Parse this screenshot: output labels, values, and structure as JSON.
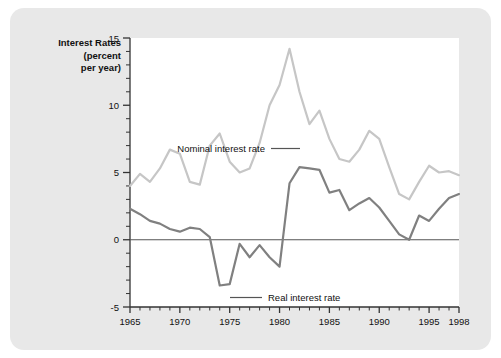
{
  "figure": {
    "background_color": "#e8e8e8",
    "plot_background_color": "#ffffff",
    "page_background_color": "#ffffff"
  },
  "chart_data": {
    "type": "line",
    "title": "",
    "ylabel_lines": [
      "Interest Rates",
      "(percent",
      "per year)"
    ],
    "ylabel": "Interest Rates (percent per year)",
    "xlabel": "",
    "xlim": [
      1965,
      1998
    ],
    "ylim": [
      -5,
      15
    ],
    "y_ticks": [
      -5,
      0,
      5,
      10,
      15
    ],
    "y_tick_labels": [
      "-5",
      "0",
      "5",
      "10",
      "15"
    ],
    "y_minor_step": 1,
    "x_ticks": [
      1965,
      1970,
      1975,
      1980,
      1985,
      1990,
      1995,
      1998
    ],
    "x_tick_labels": [
      "1965",
      "1970",
      "1975",
      "1980",
      "1985",
      "1990",
      "1995",
      "1998"
    ],
    "x_minor_step": 1,
    "grid": false,
    "zero_line": 0,
    "legend_position": "inline-annotations",
    "x": [
      1965,
      1966,
      1967,
      1968,
      1969,
      1970,
      1971,
      1972,
      1973,
      1974,
      1975,
      1976,
      1977,
      1978,
      1979,
      1980,
      1981,
      1982,
      1983,
      1984,
      1985,
      1986,
      1987,
      1988,
      1989,
      1990,
      1991,
      1992,
      1993,
      1994,
      1995,
      1996,
      1997,
      1998
    ],
    "series": [
      {
        "name": "Nominal interest rate",
        "color": "#c6c6c6",
        "label": "Nominal interest rate",
        "values": [
          4.0,
          4.9,
          4.3,
          5.3,
          6.7,
          6.4,
          4.3,
          4.1,
          7.0,
          7.9,
          5.8,
          5.0,
          5.3,
          7.2,
          10.0,
          11.5,
          14.2,
          11.0,
          8.6,
          9.6,
          7.5,
          6.0,
          5.8,
          6.7,
          8.1,
          7.5,
          5.4,
          3.4,
          3.0,
          4.3,
          5.5,
          5.0,
          5.1,
          4.8
        ]
      },
      {
        "name": "Real interest rate",
        "color": "#808080",
        "label": "Real interest rate",
        "values": [
          2.3,
          1.9,
          1.4,
          1.2,
          0.8,
          0.6,
          0.9,
          0.8,
          0.2,
          -3.4,
          -3.3,
          -0.3,
          -1.3,
          -0.4,
          -1.3,
          -2.0,
          4.2,
          5.4,
          5.3,
          5.2,
          3.5,
          3.7,
          2.2,
          2.7,
          3.1,
          2.4,
          1.4,
          0.4,
          0.0,
          1.8,
          1.4,
          2.3,
          3.1,
          3.4
        ]
      }
    ],
    "annotations": [
      {
        "text": "Nominal interest rate",
        "series": "Nominal interest rate",
        "align": "right",
        "leader": "right"
      },
      {
        "text": "Real interest rate",
        "series": "Real interest rate",
        "align": "left",
        "leader": "left"
      }
    ]
  }
}
